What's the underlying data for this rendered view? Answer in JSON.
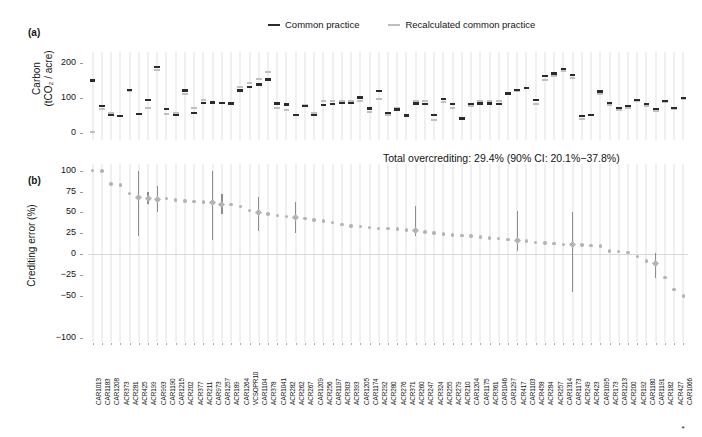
{
  "figure": {
    "width": 702,
    "height": 437,
    "background": "#ffffff"
  },
  "legend": {
    "items": [
      {
        "label": "Common practice",
        "color": "#2b2b2b",
        "key": "common-practice"
      },
      {
        "label": "Recalculated common practice",
        "color": "#bdbdbd",
        "key": "recalculated-common-practice"
      }
    ]
  },
  "panel_a": {
    "tag": "(a)",
    "ylabel_line1": "Carbon",
    "ylabel_line2": "(tCO₂ / acre)",
    "yticks": [
      "0",
      "100",
      "200"
    ],
    "ylim": [
      -20,
      230
    ]
  },
  "panel_b": {
    "tag": "(b)",
    "ylabel": "Crediting error (%)",
    "yticks": [
      "100",
      "75",
      "50",
      "25",
      "0",
      "−25",
      "−50",
      "−100"
    ],
    "ylim": [
      -105,
      108
    ],
    "annotation": "Total overcrediting: 29.4% (90% CI: 20.1%−37.8%)",
    "footnote_marker": "*"
  },
  "chart_data": {
    "type": "scatter",
    "title": "",
    "panels": [
      {
        "id": "a",
        "type": "segments",
        "ylabel": "Carbon (tCO2 / acre)",
        "ylim": [
          -20,
          230
        ],
        "yticks": [
          0,
          100,
          200
        ],
        "series": [
          {
            "name": "Common practice",
            "color": "#2b2b2b"
          },
          {
            "name": "Recalculated common practice",
            "color": "#bdbdbd"
          }
        ]
      },
      {
        "id": "b",
        "type": "pointrange",
        "ylabel": "Crediting error (%)",
        "ylim": [
          -105,
          108
        ],
        "yticks": [
          100,
          75,
          50,
          25,
          0,
          -25,
          -50,
          -100
        ],
        "grid": false,
        "zeroline": true
      }
    ],
    "categories": [
      "CAR1013",
      "CAR1183",
      "CAR1208",
      "ACR373",
      "ACR281",
      "ACR425",
      "ACR199",
      "CAR993",
      "CAR1190",
      "CAR1215",
      "ACR202",
      "ACR377",
      "ACR211",
      "CAR973",
      "CAR1257",
      "ACR189",
      "CAR1264",
      "VCSOPR10",
      "CAR1104",
      "ACR378",
      "CAR1041",
      "ACR282",
      "ACR262",
      "ACR267",
      "CAR1209",
      "ACR256",
      "CAR1197",
      "ACR303",
      "ACR393",
      "CAR1205",
      "CAR1174",
      "ACR292",
      "ACR280",
      "ACR276",
      "ACR371",
      "ACR260",
      "ACR247",
      "ACR324",
      "ACR255",
      "ACR279",
      "ACR210",
      "CAR1204",
      "CAR1175",
      "ACR361",
      "CAR1046",
      "CAR1297",
      "ACR417",
      "CAR1103",
      "ACR458",
      "ACR284",
      "ACR257",
      "CAR1314",
      "CAR1173",
      "ACR249",
      "ACR423",
      "CAR1095",
      "ACR173",
      "CAR1213",
      "ACR200",
      "ACR192",
      "CAR1180",
      "CAR1191",
      "ACR182",
      "ACR427",
      "CAR1066"
    ],
    "common_practice": [
      150,
      78,
      51,
      48,
      122,
      55,
      95,
      188,
      68,
      52,
      121,
      58,
      86,
      87,
      86,
      84,
      121,
      131,
      138,
      152,
      84,
      81,
      52,
      77,
      51,
      80,
      82,
      86,
      85,
      101,
      70,
      120,
      58,
      67,
      50,
      84,
      82,
      52,
      97,
      82,
      42,
      82,
      84,
      84,
      82,
      113,
      122,
      128,
      95,
      162,
      170,
      182,
      165,
      48,
      52,
      118,
      86,
      72,
      78,
      95,
      82,
      68,
      92,
      72,
      100
    ],
    "recalculated_common_practice": [
      3,
      67,
      58,
      49,
      120,
      53,
      70,
      178,
      54,
      56,
      110,
      70,
      95,
      85,
      84,
      84,
      130,
      142,
      152,
      172,
      70,
      66,
      52,
      80,
      58,
      92,
      92,
      92,
      92,
      90,
      60,
      96,
      52,
      70,
      48,
      90,
      92,
      38,
      88,
      72,
      40,
      78,
      90,
      92,
      92,
      112,
      118,
      128,
      82,
      150,
      162,
      175,
      155,
      40,
      50,
      112,
      80,
      66,
      72,
      90,
      78,
      62,
      88,
      68,
      96
    ],
    "crediting_error": [
      100.0,
      99.5,
      84.0,
      83.0,
      73.0,
      67.5,
      67.0,
      66.0,
      66.5,
      65.0,
      63.5,
      63.0,
      62.5,
      62.0,
      60.0,
      59.5,
      57.0,
      52.0,
      50.0,
      48.0,
      46.5,
      45.5,
      44.0,
      42.5,
      41.0,
      40.0,
      38.0,
      35.5,
      34.0,
      33.5,
      32.0,
      31.0,
      30.5,
      30.0,
      29.0,
      28.0,
      26.5,
      25.5,
      24.0,
      23.0,
      22.5,
      22.0,
      20.5,
      19.5,
      18.5,
      18.0,
      17.0,
      16.0,
      14.0,
      13.5,
      12.5,
      12.0,
      11.5,
      11.0,
      10.5,
      10.0,
      4.0,
      3.0,
      2.0,
      -3.0,
      -8.0,
      -11.0,
      -28.0,
      -42.0,
      -50.0,
      -55.0,
      -60.0,
      -85.0
    ],
    "ci_low": [
      100.0,
      99.5,
      84.0,
      83.0,
      73.0,
      22.0,
      60.0,
      50.0,
      66.5,
      65.0,
      63.5,
      63.0,
      62.5,
      17.0,
      48.0,
      59.5,
      57.0,
      52.0,
      28.0,
      48.0,
      46.5,
      45.5,
      26.0,
      42.5,
      41.0,
      40.0,
      38.0,
      35.5,
      34.0,
      33.5,
      32.0,
      31.0,
      30.5,
      30.0,
      29.0,
      22.0,
      26.5,
      25.5,
      24.0,
      23.0,
      22.5,
      22.0,
      20.5,
      19.5,
      18.5,
      18.0,
      4.0,
      16.0,
      14.0,
      13.5,
      12.5,
      12.0,
      -45.0,
      11.0,
      10.5,
      10.0,
      4.0,
      3.0,
      2.0,
      -3.0,
      -8.0,
      -28.0,
      -28.0,
      -42.0,
      -50.0,
      -62.0,
      -70.0,
      -100.0
    ],
    "ci_high": [
      100.0,
      99.5,
      84.0,
      83.0,
      73.0,
      100.0,
      75.0,
      82.0,
      66.5,
      65.0,
      63.5,
      63.0,
      62.5,
      100.0,
      72.0,
      59.5,
      57.0,
      52.0,
      68.0,
      48.0,
      46.5,
      45.5,
      62.0,
      42.5,
      41.0,
      40.0,
      38.0,
      35.5,
      34.0,
      33.5,
      32.0,
      31.0,
      30.5,
      30.0,
      29.0,
      58.0,
      26.5,
      25.5,
      24.0,
      23.0,
      22.5,
      22.0,
      20.5,
      19.5,
      18.5,
      18.0,
      52.0,
      16.0,
      14.0,
      13.5,
      12.5,
      12.0,
      50.0,
      11.0,
      10.5,
      10.0,
      4.0,
      3.0,
      2.0,
      -3.0,
      -8.0,
      2.0,
      -28.0,
      -42.0,
      -50.0,
      -48.0,
      -52.0,
      -62.0
    ]
  }
}
